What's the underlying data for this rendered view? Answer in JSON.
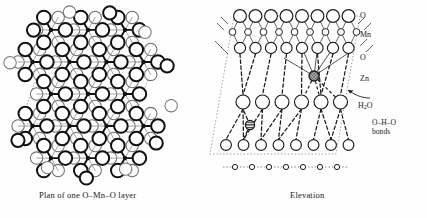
{
  "figure": {
    "title_left": "Plan of one O–Mn–O layer",
    "title_right": "Elevation",
    "background": "#ffffff",
    "ink": "#111111"
  },
  "labels": {
    "o_top": "O",
    "mn": "Mn",
    "o_mid": "O",
    "zn": "Zn",
    "h2o_main": "H",
    "h2o_sub": "2",
    "h2o_rest": "O",
    "bonds_line1": "O–H–O",
    "bonds_line2": "bonds"
  },
  "legend_order": [
    "O",
    "Mn",
    "O",
    "Zn",
    "H2O",
    "O-H-O bonds"
  ],
  "chart_data": {
    "type": "diagram",
    "panels": [
      {
        "name": "plan",
        "caption": "Plan of one O–Mn–O layer",
        "description": "Hexagonal close packed O–Mn–O sheet viewed normal to layer; bold circles are upper-layer O atoms, thin circles are lower-layer O atoms, small hubs are Mn with six bonds each; dotted parallelogram marks the unit cell.",
        "atom_species": [
          "O (upper)",
          "O (lower)",
          "Mn"
        ],
        "mn_coordination": 6,
        "lattice": "hexagonal",
        "unit_cell_shown": true
      },
      {
        "name": "elevation",
        "caption": "Elevation",
        "description": "Side view showing stacking sequence: O layer, Mn layer, O layer, interlayer Zn, H2O layer, O–H–O hydrogen bonds, lower O layer.",
        "rows": [
          {
            "id": "o-top",
            "species": "O",
            "count": 8,
            "radius": 6.4
          },
          {
            "id": "mn",
            "species": "Mn",
            "count": 9,
            "radius": 3.4
          },
          {
            "id": "o-second",
            "species": "O",
            "count": 8,
            "radius": 5.6
          },
          {
            "id": "zn",
            "species": "Zn",
            "count": 2,
            "radius": 5.0,
            "fill": "hatched"
          },
          {
            "id": "h2o",
            "species": "H2O",
            "count": 6,
            "radius": 7.0
          },
          {
            "id": "o-lower",
            "species": "O",
            "count": 8,
            "radius": 5.4
          },
          {
            "id": "o-bottom",
            "species": "O",
            "count": 7,
            "radius": 2.6
          }
        ],
        "bond_styles": {
          "mn_o": "solid thin",
          "h_bond": "dashed",
          "unit_cell": "dotted"
        },
        "unit_cell_shown": true
      }
    ]
  }
}
